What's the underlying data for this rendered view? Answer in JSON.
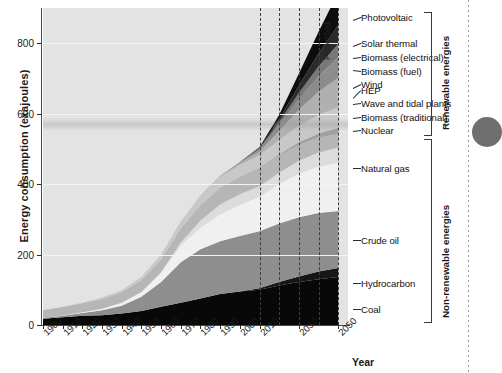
{
  "chart_data": {
    "type": "area",
    "title": "",
    "xlabel": "Year",
    "ylabel": "Energy consumption (exajoules)",
    "ylim": [
      0,
      900
    ],
    "yticks": [
      0,
      200,
      400,
      600,
      800
    ],
    "xlim": [
      1900,
      2055
    ],
    "xticks": [
      1900,
      1910,
      1920,
      1930,
      1940,
      1950,
      1960,
      1970,
      1980,
      1990,
      2000,
      2010,
      2030,
      2050
    ],
    "grid": true,
    "legend_position": "right",
    "projected_from": 2010,
    "projected_label": "Projected",
    "stack_order_bottom_to_top": [
      "Coal",
      "Hydrocarbon",
      "Crude oil",
      "Natural gas",
      "Nuclear",
      "Biomass (traditional)",
      "Wave and tidal plants",
      "HEP",
      "Wind",
      "Biomass (fuel)",
      "Biomass (electrical)",
      "Solar thermal",
      "Photovoltaic"
    ],
    "x": [
      1900,
      1910,
      1920,
      1930,
      1940,
      1950,
      1960,
      1970,
      1980,
      1990,
      2000,
      2010,
      2020,
      2030,
      2040,
      2050
    ],
    "series": [
      {
        "name": "Coal",
        "color": "#080808",
        "values": [
          18,
          22,
          26,
          28,
          33,
          40,
          52,
          63,
          75,
          88,
          95,
          100,
          112,
          122,
          130,
          136
        ]
      },
      {
        "name": "Hydrocarbon",
        "color": "#161616",
        "values": [
          0,
          0,
          0,
          0,
          0,
          0,
          0,
          0,
          0,
          0,
          0,
          4,
          10,
          16,
          22,
          26
        ]
      },
      {
        "name": "Crude oil",
        "color": "#8e8e8e",
        "values": [
          2,
          4,
          8,
          14,
          22,
          40,
          70,
          115,
          140,
          150,
          158,
          162,
          166,
          168,
          166,
          162
        ]
      },
      {
        "name": "Natural gas",
        "color": "#f0f0f0",
        "values": [
          0,
          1,
          2,
          4,
          8,
          14,
          26,
          48,
          62,
          76,
          88,
          98,
          112,
          124,
          132,
          136
        ]
      },
      {
        "name": "Nuclear",
        "color": "#dcdcdc",
        "values": [
          0,
          0,
          0,
          0,
          0,
          0,
          2,
          8,
          20,
          28,
          30,
          30,
          32,
          36,
          40,
          44
        ]
      },
      {
        "name": "Biomass (traditional)",
        "color": "#b6b6b6",
        "values": [
          22,
          24,
          26,
          28,
          30,
          33,
          36,
          40,
          44,
          48,
          50,
          52,
          50,
          46,
          42,
          38
        ]
      },
      {
        "name": "Wave and tidal plants",
        "color": "#a0a0a0",
        "values": [
          0,
          0,
          0,
          0,
          0,
          0,
          0,
          0,
          0,
          0,
          0,
          1,
          3,
          7,
          12,
          18
        ]
      },
      {
        "name": "HEP",
        "color": "#c8c8c8",
        "values": [
          0,
          1,
          2,
          4,
          6,
          9,
          14,
          20,
          26,
          30,
          33,
          35,
          40,
          46,
          52,
          58
        ]
      },
      {
        "name": "Wind",
        "color": "#b0b0b0",
        "values": [
          0,
          0,
          0,
          0,
          0,
          0,
          0,
          0,
          1,
          2,
          5,
          10,
          26,
          46,
          66,
          84
        ]
      },
      {
        "name": "Biomass (fuel)",
        "color": "#8c8c8c",
        "values": [
          0,
          0,
          0,
          0,
          0,
          0,
          0,
          0,
          0,
          1,
          3,
          6,
          16,
          30,
          44,
          58
        ]
      },
      {
        "name": "Biomass (electrical)",
        "color": "#787878",
        "values": [
          0,
          0,
          0,
          0,
          0,
          0,
          0,
          0,
          0,
          0,
          1,
          3,
          9,
          18,
          28,
          38
        ]
      },
      {
        "name": "Solar thermal",
        "color": "#2b2b2b",
        "values": [
          0,
          0,
          0,
          0,
          0,
          0,
          0,
          0,
          0,
          0,
          0,
          2,
          8,
          20,
          36,
          54
        ]
      },
      {
        "name": "Photovoltaic",
        "color": "#0d0d0d",
        "values": [
          0,
          0,
          0,
          0,
          0,
          0,
          0,
          0,
          0,
          0,
          0,
          2,
          12,
          34,
          62,
          92
        ]
      }
    ]
  },
  "axes": {
    "ylabel": "Energy consumption (exajoules)",
    "xlabel": "Year",
    "ytick_labels": [
      "800",
      "600",
      "400",
      "200",
      "0"
    ],
    "xtick_labels": [
      "1900",
      "1910",
      "1920",
      "1930",
      "1940",
      "1950",
      "1960",
      "1970",
      "1980",
      "1990",
      "2000",
      "2010",
      "2030",
      "2050"
    ]
  },
  "annotations": {
    "projected": "Projected"
  },
  "legend": {
    "items": [
      {
        "label": "Photovoltaic"
      },
      {
        "label": "Solar thermal"
      },
      {
        "label": "Biomass (electrical)"
      },
      {
        "label": "Biomass (fuel)"
      },
      {
        "label": "Wind"
      },
      {
        "label": "HEP"
      },
      {
        "label": "Wave and tidal plants"
      },
      {
        "label": "Biomass (traditional)"
      },
      {
        "label": "Nuclear"
      },
      {
        "label": "Natural gas"
      },
      {
        "label": "Crude oil"
      },
      {
        "label": "Hydrocarbon"
      },
      {
        "label": "Coal"
      }
    ]
  },
  "brackets": [
    {
      "label": "Renewable energies"
    },
    {
      "label": "Non-renewable energies"
    }
  ]
}
